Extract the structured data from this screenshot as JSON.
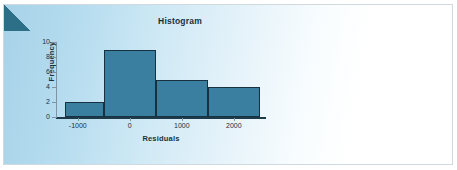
{
  "figure": {
    "background_color": "#ffffff",
    "panel_gradient_from": "#a7d2e8",
    "panel_gradient_to": "#ffffff",
    "corner_wedge_color": "#2c6f86",
    "frame_color": "#cfd9de"
  },
  "chart_data": {
    "type": "bar",
    "title": "Histogram",
    "xlabel": "Residuals",
    "ylabel": "Frequency",
    "categories": [
      "-1250 to -500",
      "-500 to 500",
      "500 to 1500",
      "1500 to 2500"
    ],
    "values": [
      2,
      9,
      5,
      4
    ],
    "bin_edges": [
      -1250,
      -500,
      500,
      1500,
      2500
    ],
    "x": [
      -875,
      0,
      1000,
      2000
    ],
    "xlim": [
      -1400,
      2600
    ],
    "ylim": [
      0,
      10
    ],
    "xticks": [
      -1000,
      0,
      1000,
      2000
    ],
    "xtick_labels": [
      "-1000",
      "0",
      "1000",
      "2000"
    ],
    "yticks": [
      0,
      2,
      4,
      6,
      8,
      10
    ],
    "ytick_labels": [
      "0",
      "2",
      "4",
      "6",
      "8",
      "10"
    ],
    "grid": false,
    "legend": false,
    "bar_fill_color": "#3a7fa0",
    "bar_edge_color": "#16313f"
  }
}
